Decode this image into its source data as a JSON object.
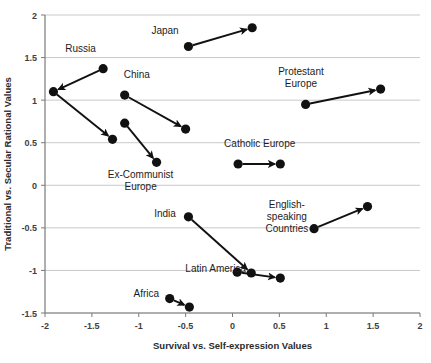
{
  "chart_data": {
    "type": "scatter",
    "title": "",
    "xlabel": "Survival vs. Self-expression Values",
    "ylabel": "Traditional vs. Secular Rational Values",
    "xlim": [
      -2,
      2
    ],
    "ylim": [
      -1.5,
      2
    ],
    "xticks": [
      "-2",
      "-1.5",
      "-1",
      "-0.5",
      "0",
      "0.5",
      "1",
      "1.5",
      "2"
    ],
    "xtick_values": [
      -2,
      -1.5,
      -1,
      -0.5,
      0,
      0.5,
      1,
      1.5,
      2
    ],
    "yticks": [
      "2",
      "1.5",
      "1",
      "0.5",
      "0",
      "-0.5",
      "-1",
      "-1.5"
    ],
    "ytick_values": [
      2,
      1.5,
      1,
      0.5,
      0,
      -0.5,
      -1,
      -1.5
    ],
    "grid": "horizontal",
    "legend": "none",
    "marker": "filled-circle",
    "connector": "arrow",
    "series": [
      {
        "name": "Japan",
        "label": "Japan",
        "label_lines": [
          "Japan"
        ],
        "label_x": -0.72,
        "label_y": 1.78,
        "start": {
          "x": -0.47,
          "y": 1.63
        },
        "end": {
          "x": 0.21,
          "y": 1.85
        }
      },
      {
        "name": "Russia",
        "label": "Russia",
        "label_lines": [
          "Russia"
        ],
        "label_x": -1.62,
        "label_y": 1.56,
        "start": {
          "x": -1.38,
          "y": 1.37
        },
        "end": {
          "x": -1.91,
          "y": 1.1
        }
      },
      {
        "name": "China",
        "label": "China",
        "label_lines": [
          "China"
        ],
        "label_x": -1.02,
        "label_y": 1.26,
        "start": {
          "x": -1.15,
          "y": 1.06
        },
        "end": {
          "x": -0.5,
          "y": 0.66
        }
      },
      {
        "name": "Ex-Communist Europe",
        "label": "Ex-Communist Europe",
        "label_lines": [
          "Ex-Communist",
          "Europe"
        ],
        "label_x": -0.98,
        "label_y": 0.08,
        "start": {
          "x": -1.15,
          "y": 0.73
        },
        "end": {
          "x": -0.81,
          "y": 0.27
        }
      },
      {
        "name": "Russia secondary",
        "label": "",
        "label_lines": [],
        "label_x": null,
        "label_y": null,
        "start": {
          "x": -1.91,
          "y": 1.1
        },
        "end": {
          "x": -1.28,
          "y": 0.54
        }
      },
      {
        "name": "Protestant Europe",
        "label": "Protestant Europe",
        "label_lines": [
          "Protestant",
          "Europe"
        ],
        "label_x": 0.73,
        "label_y": 1.3,
        "start": {
          "x": 0.78,
          "y": 0.95
        },
        "end": {
          "x": 1.58,
          "y": 1.13
        }
      },
      {
        "name": "Catholic Europe",
        "label": "Catholic Europe",
        "label_lines": [
          "Catholic Europe"
        ],
        "label_x": 0.29,
        "label_y": 0.45,
        "start": {
          "x": 0.06,
          "y": 0.25
        },
        "end": {
          "x": 0.51,
          "y": 0.25
        }
      },
      {
        "name": "India",
        "label": "India",
        "label_lines": [
          "India"
        ],
        "label_x": -0.72,
        "label_y": -0.37,
        "start": {
          "x": -0.47,
          "y": -0.37
        },
        "end": {
          "x": 0.2,
          "y": -1.03
        }
      },
      {
        "name": "English-speaking Countries",
        "label": "English-speaking Countries",
        "label_lines": [
          "English-",
          "speaking",
          "Countries"
        ],
        "label_x": 0.58,
        "label_y": -0.27,
        "start": {
          "x": 0.87,
          "y": -0.51
        },
        "end": {
          "x": 1.44,
          "y": -0.25
        }
      },
      {
        "name": "Latin America",
        "label": "Latin America",
        "label_lines": [
          "Latin America"
        ],
        "label_x": -0.18,
        "label_y": -1.02,
        "start": {
          "x": 0.05,
          "y": -1.02
        },
        "end": {
          "x": 0.51,
          "y": -1.09
        }
      },
      {
        "name": "Africa",
        "label": "Africa",
        "label_lines": [
          "Africa"
        ],
        "label_x": -0.92,
        "label_y": -1.31,
        "start": {
          "x": -0.67,
          "y": -1.33
        },
        "end": {
          "x": -0.46,
          "y": -1.43
        }
      }
    ]
  }
}
